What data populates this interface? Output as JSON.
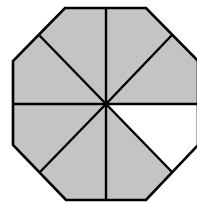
{
  "figure": {
    "shape": "octagon",
    "total_sectors": 8,
    "shaded_sectors": 7,
    "unshaded_sectors": 1,
    "unshaded_sector_position": "right-lower (between east spoke and south-east spoke)",
    "colors": {
      "shaded": "#c4c4c4",
      "unshaded": "#ffffff",
      "stroke": "#000000",
      "background": "#ffffff"
    },
    "center": [
      106,
      104
    ],
    "vertices": [
      [
        65,
        8
      ],
      [
        146,
        8
      ],
      [
        198,
        61
      ],
      [
        198,
        145
      ],
      [
        146,
        200
      ],
      [
        66,
        200
      ],
      [
        13,
        145
      ],
      [
        13,
        61
      ]
    ],
    "spoke_endpoints": [
      [
        106,
        8
      ],
      [
        172,
        35
      ],
      [
        198,
        104
      ],
      [
        172,
        172
      ],
      [
        106,
        200
      ],
      [
        40,
        172
      ],
      [
        13,
        104
      ],
      [
        39,
        35
      ]
    ]
  }
}
